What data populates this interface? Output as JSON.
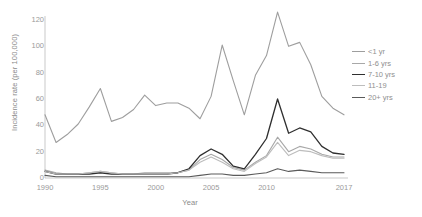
{
  "chart_data": {
    "type": "line",
    "title": "",
    "subtitle": "",
    "xlabel": "Year",
    "ylabel": "Incidence rate (per 100,000)",
    "xlim": [
      1990,
      2017
    ],
    "ylim": [
      0,
      120
    ],
    "ytick_values": [
      0,
      20,
      40,
      60,
      80,
      100,
      120
    ],
    "ytick_labels": [
      "0",
      "20",
      "40",
      "60",
      "80",
      "100",
      "120"
    ],
    "xtick_values": [
      1990,
      1995,
      2000,
      2005,
      2010,
      2017
    ],
    "xtick_labels": [
      "1990",
      "1995",
      "2000",
      "2005",
      "2010",
      "2017"
    ],
    "grid": false,
    "legend_position": "right",
    "x": [
      1990,
      1991,
      1992,
      1993,
      1994,
      1995,
      1996,
      1997,
      1998,
      1999,
      2000,
      2001,
      2002,
      2003,
      2004,
      2005,
      2006,
      2007,
      2008,
      2009,
      2010,
      2011,
      2012,
      2013,
      2014,
      2015,
      2016,
      2017
    ],
    "series": [
      {
        "name": "<1 yr",
        "color": "#9e9e9e",
        "width": 1.1,
        "values": [
          48,
          27,
          33,
          41,
          54,
          68,
          43,
          46,
          52,
          63,
          55,
          57,
          57,
          53,
          45,
          62,
          101,
          74,
          48,
          78,
          93,
          126,
          100,
          103,
          86,
          62,
          53,
          48
        ]
      },
      {
        "name": "1-6 yrs",
        "color": "#a8a8a8",
        "width": 1.1,
        "values": [
          6,
          4,
          3,
          3,
          4,
          5,
          4,
          3,
          3,
          4,
          4,
          4,
          4,
          6,
          14,
          18,
          14,
          8,
          6,
          12,
          17,
          31,
          20,
          24,
          22,
          18,
          16,
          16
        ]
      },
      {
        "name": "7-10 yrs",
        "color": "#2f2f2f",
        "width": 1.3,
        "values": [
          5,
          3,
          3,
          3,
          3,
          4,
          3,
          3,
          3,
          3,
          3,
          3,
          4,
          7,
          17,
          22,
          18,
          9,
          7,
          18,
          30,
          60,
          34,
          38,
          35,
          24,
          19,
          18
        ]
      },
      {
        "name": "11-19",
        "color": "#bdbdbd",
        "width": 1.1,
        "values": [
          5,
          3,
          3,
          3,
          4,
          5,
          4,
          3,
          3,
          3,
          3,
          3,
          4,
          6,
          12,
          16,
          12,
          7,
          5,
          11,
          16,
          27,
          17,
          21,
          20,
          17,
          15,
          15
        ]
      },
      {
        "name": "20+ yrs",
        "color": "#5a5a5a",
        "width": 1.1,
        "values": [
          2,
          1,
          1,
          1,
          1,
          1,
          1,
          1,
          1,
          1,
          1,
          1,
          1,
          1,
          2,
          3,
          3,
          2,
          2,
          3,
          4,
          7,
          5,
          6,
          5,
          4,
          4,
          4
        ]
      }
    ]
  },
  "legend": {
    "entries": [
      {
        "label": "<1 yr"
      },
      {
        "label": "1-6 yrs"
      },
      {
        "label": "7-10 yrs"
      },
      {
        "label": "11-19"
      },
      {
        "label": "20+ yrs"
      }
    ]
  }
}
